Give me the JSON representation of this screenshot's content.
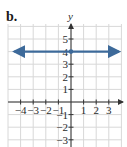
{
  "part_label": "b.",
  "chart_data": {
    "type": "line",
    "title": "",
    "part_label": "b.",
    "xlabel": "",
    "ylabel": "y",
    "xlim": [
      -4.5,
      3.8
    ],
    "ylim": [
      -3.2,
      6
    ],
    "grid": true,
    "x_ticks": [
      -4,
      -3,
      -2,
      -1,
      1,
      2,
      3
    ],
    "x_tick_labels": [
      "−4",
      "−3",
      "−2",
      "−1",
      "1",
      "2",
      "3"
    ],
    "y_ticks": [
      5,
      4,
      3,
      2,
      1,
      -1,
      -2,
      -3
    ],
    "y_tick_labels": [
      "5",
      "4",
      "3",
      "2",
      "1",
      "−1",
      "−2",
      "−3"
    ],
    "series": [
      {
        "name": "y = 4",
        "x": [
          -4.5,
          3.8
        ],
        "y": [
          4,
          4
        ],
        "color": "#3d6a9a",
        "arrows_both_ends": true,
        "marked_point": [
          0,
          4
        ]
      }
    ],
    "legend": null
  },
  "colors": {
    "grid": "#d8d8d8",
    "axis": "#333333",
    "line": "#3d6a9a"
  }
}
